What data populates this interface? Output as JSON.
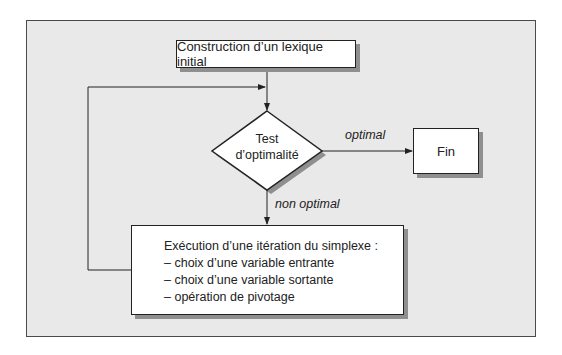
{
  "diagram": {
    "nodes": {
      "start": {
        "label": "Construction d’un lexique initial",
        "shape": "rectangle"
      },
      "test": {
        "label_line1": "Test",
        "label_line2": "d’optimalité",
        "shape": "diamond"
      },
      "end": {
        "label": "Fin",
        "shape": "rectangle"
      },
      "iteration": {
        "title": "Exécution d’une itération du simplexe :",
        "items": [
          "– choix d’une variable entrante",
          "– choix d’une variable sortante",
          "– opération de pivotage"
        ],
        "shape": "rectangle"
      }
    },
    "edges": {
      "optimal_label": "optimal",
      "non_optimal_label": "non optimal"
    },
    "colors": {
      "background": "#e9e9e9",
      "box_fill": "#ffffff",
      "stroke": "#222222",
      "shadow": "#8f8f8f"
    }
  }
}
